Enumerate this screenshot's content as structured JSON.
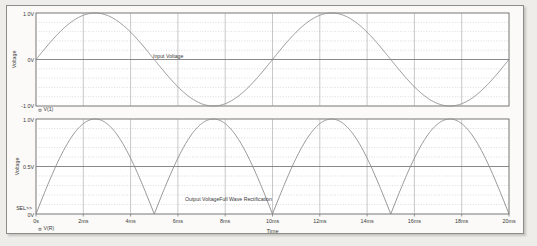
{
  "window": {
    "app": "probe-plot",
    "background_color": "#fbfaf8",
    "trace_color": "#8a8a8a",
    "axis_color": "#555555",
    "grid_color": "#b9b9b9"
  },
  "axis": {
    "x_label": "Time",
    "x_ticks": [
      "0s",
      "2ms",
      "4ms",
      "6ms",
      "8ms",
      "10ms",
      "12ms",
      "14ms",
      "16ms",
      "18ms",
      "20ms"
    ],
    "y_label_top": "Voltage",
    "y_label_bottom": "Voltage",
    "y_ticks_top": [
      "1.0V",
      "0V",
      "-1.0V"
    ],
    "y_ticks_bottom": [
      "1.0V",
      "0.5V",
      "0V"
    ],
    "sel_marker": "SEL>>"
  },
  "legend": {
    "top": "V(1)",
    "bottom": "V(R)",
    "marker": "▫"
  },
  "annotations": {
    "top": "Input Voltage",
    "bottom": "Output VoltageFull Wave Rectification"
  },
  "chart_data": [
    {
      "type": "line",
      "title": "Input Voltage",
      "xlabel": "Time",
      "ylabel": "Voltage",
      "xlim": [
        0,
        20
      ],
      "ylim": [
        -1.0,
        1.0
      ],
      "x_unit": "ms",
      "y_unit": "V",
      "grid": true,
      "legend": "V(1)",
      "series": [
        {
          "name": "V(1)",
          "waveform": "sine",
          "amplitude": 1.0,
          "period_ms": 10,
          "phase_deg": 0,
          "offset": 0,
          "x": [
            0,
            0.5,
            1,
            1.5,
            2,
            2.5,
            3,
            3.5,
            4,
            4.5,
            5,
            5.5,
            6,
            6.5,
            7,
            7.5,
            8,
            8.5,
            9,
            9.5,
            10,
            10.5,
            11,
            11.5,
            12,
            12.5,
            13,
            13.5,
            14,
            14.5,
            15,
            15.5,
            16,
            16.5,
            17,
            17.5,
            18,
            18.5,
            19,
            19.5,
            20
          ],
          "values": [
            0,
            0.309,
            0.588,
            0.809,
            0.951,
            1.0,
            0.951,
            0.809,
            0.588,
            0.309,
            0,
            -0.309,
            -0.588,
            -0.809,
            -0.951,
            -1.0,
            -0.951,
            -0.809,
            -0.588,
            -0.309,
            0,
            0.309,
            0.588,
            0.809,
            0.951,
            1.0,
            0.951,
            0.809,
            0.588,
            0.309,
            0,
            -0.309,
            -0.588,
            -0.809,
            -0.951,
            -1.0,
            -0.951,
            -0.809,
            -0.588,
            -0.309,
            0
          ]
        }
      ]
    },
    {
      "type": "line",
      "title": "Output VoltageFull Wave Rectification",
      "xlabel": "Time",
      "ylabel": "Voltage",
      "xlim": [
        0,
        20
      ],
      "ylim": [
        0,
        1.0
      ],
      "x_unit": "ms",
      "y_unit": "V",
      "grid": true,
      "legend": "V(R)",
      "series": [
        {
          "name": "V(R)",
          "waveform": "full-wave-rectified-sine",
          "amplitude": 1.0,
          "period_ms": 5,
          "offset": 0,
          "x": [
            0,
            0.5,
            1,
            1.5,
            2,
            2.5,
            3,
            3.5,
            4,
            4.5,
            5,
            5.5,
            6,
            6.5,
            7,
            7.5,
            8,
            8.5,
            9,
            9.5,
            10,
            10.5,
            11,
            11.5,
            12,
            12.5,
            13,
            13.5,
            14,
            14.5,
            15,
            15.5,
            16,
            16.5,
            17,
            17.5,
            18,
            18.5,
            19,
            19.5,
            20
          ],
          "values": [
            0,
            0.309,
            0.588,
            0.809,
            0.951,
            1.0,
            0.951,
            0.809,
            0.588,
            0.309,
            0,
            0.309,
            0.588,
            0.809,
            0.951,
            1.0,
            0.951,
            0.809,
            0.588,
            0.309,
            0,
            0.309,
            0.588,
            0.809,
            0.951,
            1.0,
            0.951,
            0.809,
            0.588,
            0.309,
            0,
            0.309,
            0.588,
            0.809,
            0.951,
            1.0,
            0.951,
            0.809,
            0.588,
            0.309,
            0
          ]
        }
      ]
    }
  ]
}
